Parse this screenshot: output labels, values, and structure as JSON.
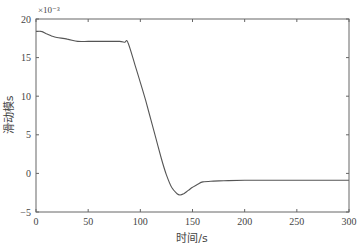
{
  "chart_data": {
    "type": "line",
    "title": "",
    "xlabel": "时间/s",
    "ylabel": "滑动模s",
    "y_multiplier": "×10⁻³",
    "xlim": [
      0,
      300
    ],
    "ylim": [
      -5,
      20
    ],
    "xticks": [
      0,
      50,
      100,
      150,
      200,
      250,
      300
    ],
    "yticks": [
      -5,
      0,
      5,
      10,
      15,
      20
    ],
    "grid": false,
    "legend": null,
    "series": [
      {
        "name": "滑动模s",
        "color": "#555555",
        "x": [
          0,
          5,
          10,
          15,
          20,
          30,
          40,
          50,
          60,
          70,
          80,
          85,
          88,
          95,
          100,
          105,
          110,
          115,
          120,
          125,
          130,
          135,
          138,
          142,
          146,
          150,
          155,
          160,
          170,
          180,
          200,
          250,
          300
        ],
        "y": [
          18.4,
          18.4,
          18.1,
          17.8,
          17.6,
          17.4,
          17.1,
          17.1,
          17.1,
          17.1,
          17.1,
          17.0,
          17.0,
          14.0,
          11.8,
          9.5,
          7.0,
          4.5,
          2.0,
          -0.2,
          -1.8,
          -2.6,
          -2.8,
          -2.6,
          -2.2,
          -1.8,
          -1.4,
          -1.1,
          -1.0,
          -0.95,
          -0.9,
          -0.9,
          -0.9
        ]
      }
    ]
  }
}
